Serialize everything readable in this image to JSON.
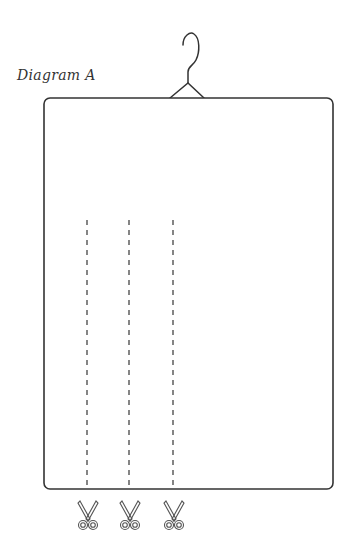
{
  "diagram": {
    "title": "Diagram A",
    "elements": {
      "hanger": "coat-hanger-icon",
      "garment": "rectangular-sheet",
      "cut_lines": [
        {
          "x": 87,
          "style": "dashed"
        },
        {
          "x": 129,
          "style": "dashed"
        },
        {
          "x": 173,
          "style": "dashed"
        }
      ],
      "scissors": [
        "scissors-icon",
        "scissors-icon",
        "scissors-icon"
      ]
    },
    "colors": {
      "stroke": "#333333",
      "background": "#ffffff"
    }
  }
}
